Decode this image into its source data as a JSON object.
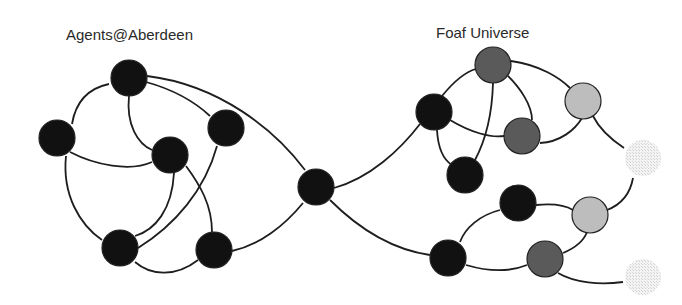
{
  "labels": {
    "left_cluster": "Agents@Aberdeen",
    "right_cluster": "Foaf Universe"
  },
  "colors": {
    "black": "#111111",
    "dark_gray": "#5a5a5a",
    "light_gray": "#bdbdbd",
    "faint": "#e6e6e6",
    "edge": "#1e1e1e"
  },
  "nodes": [
    {
      "id": "a1",
      "cluster": "Agents@Aberdeen",
      "x": 129,
      "y": 78,
      "shade": "black"
    },
    {
      "id": "a2",
      "cluster": "Agents@Aberdeen",
      "x": 57,
      "y": 138,
      "shade": "black"
    },
    {
      "id": "a3",
      "cluster": "Agents@Aberdeen",
      "x": 170,
      "y": 155,
      "shade": "black"
    },
    {
      "id": "a4",
      "cluster": "Agents@Aberdeen",
      "x": 226,
      "y": 128,
      "shade": "black"
    },
    {
      "id": "a5",
      "cluster": "Agents@Aberdeen",
      "x": 120,
      "y": 248,
      "shade": "black"
    },
    {
      "id": "a6",
      "cluster": "Agents@Aberdeen",
      "x": 214,
      "y": 250,
      "shade": "black"
    },
    {
      "id": "hub",
      "cluster": "bridge",
      "x": 316,
      "y": 187,
      "shade": "black"
    },
    {
      "id": "f1",
      "cluster": "Foaf Universe",
      "x": 493,
      "y": 65,
      "shade": "dark_gray"
    },
    {
      "id": "f2",
      "cluster": "Foaf Universe",
      "x": 434,
      "y": 112,
      "shade": "black"
    },
    {
      "id": "f3",
      "cluster": "Foaf Universe",
      "x": 522,
      "y": 136,
      "shade": "dark_gray"
    },
    {
      "id": "f4",
      "cluster": "Foaf Universe",
      "x": 583,
      "y": 101,
      "shade": "light_gray"
    },
    {
      "id": "f5",
      "cluster": "Foaf Universe",
      "x": 465,
      "y": 175,
      "shade": "black"
    },
    {
      "id": "f6",
      "cluster": "Foaf Universe",
      "x": 518,
      "y": 203,
      "shade": "black"
    },
    {
      "id": "f7",
      "cluster": "Foaf Universe",
      "x": 590,
      "y": 215,
      "shade": "light_gray"
    },
    {
      "id": "f8",
      "cluster": "Foaf Universe",
      "x": 448,
      "y": 258,
      "shade": "black"
    },
    {
      "id": "f9",
      "cluster": "Foaf Universe",
      "x": 545,
      "y": 259,
      "shade": "dark_gray"
    },
    {
      "id": "f10",
      "cluster": "Foaf Universe",
      "x": 643,
      "y": 158,
      "shade": "faint"
    },
    {
      "id": "f11",
      "cluster": "Foaf Universe",
      "x": 643,
      "y": 277,
      "shade": "faint"
    }
  ]
}
